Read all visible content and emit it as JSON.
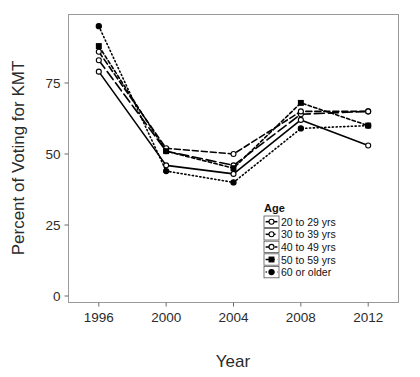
{
  "chart_data": {
    "type": "line",
    "title": "",
    "xlabel": "Year",
    "ylabel": "Percent of Voting for KMT",
    "x": [
      1996,
      2000,
      2004,
      2008,
      2012
    ],
    "xtick_labels": [
      "1996",
      "2000",
      "2004",
      "2008",
      "2012"
    ],
    "ytick_labels": [
      "0",
      "25",
      "50",
      "75"
    ],
    "yticks": [
      0,
      25,
      50,
      75
    ],
    "ylim": [
      0,
      100
    ],
    "xlim": [
      1994.2,
      2013.8
    ],
    "grid": false,
    "legend_position": "inside bottom-right",
    "legend_title": "Age",
    "series": [
      {
        "name": "20 to 29 yrs",
        "values": [
          79,
          46,
          43,
          62,
          53
        ],
        "dash": "none",
        "marker": "open-circle"
      },
      {
        "name": "30 to 39 yrs",
        "values": [
          83,
          51,
          46,
          64,
          65
        ],
        "dash": "long-dash",
        "marker": "open-circle"
      },
      {
        "name": "40 to 49 yrs",
        "values": [
          86,
          52,
          50,
          65,
          65
        ],
        "dash": "dash",
        "marker": "open-circle"
      },
      {
        "name": "50 to 59 yrs",
        "values": [
          88,
          51,
          45,
          68,
          60
        ],
        "dash": "short-dash",
        "marker": "filled-square"
      },
      {
        "name": "60 or older",
        "values": [
          95,
          44,
          40,
          59,
          60
        ],
        "dash": "dot",
        "marker": "filled-circle"
      }
    ]
  },
  "legend": {
    "title": "Age",
    "items": [
      {
        "label": "20 to 29 yrs"
      },
      {
        "label": "30 to 39 yrs"
      },
      {
        "label": "40 to 49 yrs"
      },
      {
        "label": "50 to 59 yrs"
      },
      {
        "label": "60 or older"
      }
    ]
  },
  "colors": {
    "ink": "#000000",
    "frame": "#9a9a9a",
    "text": "#2b2b2b",
    "background": "#ffffff"
  }
}
